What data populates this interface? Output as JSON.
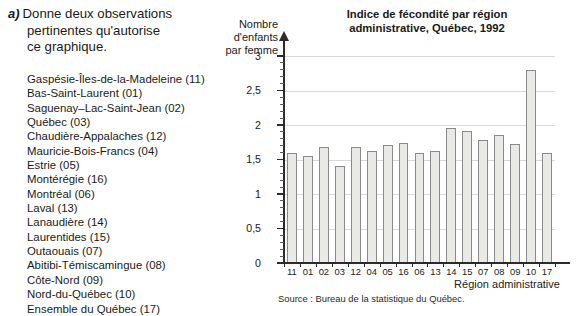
{
  "question": {
    "marker": "a)",
    "line1": "Donne deux observations",
    "line2": "pertinentes qu'autorise",
    "line3": "ce graphique."
  },
  "region_list": [
    "Gaspésie-Îles-de-la-Madeleine (11)",
    "Bas-Saint-Laurent (01)",
    "Saguenay–Lac-Saint-Jean (02)",
    "Québec (03)",
    "Chaudière-Appalaches (12)",
    "Mauricie-Bois-Francs (04)",
    "Estrie (05)",
    "Montérégie (16)",
    "Montréal (06)",
    "Laval (13)",
    "Lanaudière (14)",
    "Laurentides (15)",
    "Outaouais (07)",
    "Abitibi-Témiscamingue (08)",
    "Côte-Nord (09)",
    "Nord-du-Québec (10)",
    "Ensemble du Québec (17)"
  ],
  "chart_data": {
    "type": "bar",
    "title": "Indice de fécondité par région administrative, Québec, 1992",
    "title_line1": "Indice de fécondité par région",
    "title_line2": "administrative, Québec, 1992",
    "ylabel": "Nombre d'enfants par femme",
    "ylabel_lines": [
      "Nombre",
      "d'enfants",
      "par femme"
    ],
    "xlabel": "Région administrative",
    "source": "Source : Bureau de la statistique du Québec.",
    "categories": [
      "11",
      "01",
      "02",
      "03",
      "12",
      "04",
      "05",
      "16",
      "06",
      "13",
      "14",
      "15",
      "07",
      "08",
      "09",
      "10",
      "17"
    ],
    "category_names": [
      "Gaspésie-Îles-de-la-Madeleine",
      "Bas-Saint-Laurent",
      "Saguenay–Lac-Saint-Jean",
      "Québec",
      "Chaudière-Appalaches",
      "Mauricie-Bois-Francs",
      "Estrie",
      "Montérégie",
      "Montréal",
      "Laval",
      "Lanaudière",
      "Laurentides",
      "Outaouais",
      "Abitibi-Témiscamingue",
      "Côte-Nord",
      "Nord-du-Québec",
      "Ensemble du Québec"
    ],
    "values": [
      1.6,
      1.55,
      1.68,
      1.4,
      1.68,
      1.63,
      1.71,
      1.74,
      1.59,
      1.62,
      1.96,
      1.92,
      1.78,
      1.85,
      1.72,
      2.8,
      1.6
    ],
    "ylim": [
      0,
      3
    ],
    "ytick_labels": [
      "0",
      "0,5",
      "1",
      "1,5",
      "2",
      "2,5",
      "3"
    ],
    "ytick_values": [
      0,
      0.5,
      1,
      1.5,
      2,
      2.5,
      3
    ],
    "grid": true,
    "legend": "none",
    "bar_fill": "#e9e9e7",
    "bar_stroke": "#8a8a8a",
    "axis_color": "#2b2b2b",
    "grid_color": "#d8d8d8"
  }
}
